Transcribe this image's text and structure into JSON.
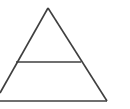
{
  "figure": {
    "name": "triangle-with-horizontal-divider",
    "canvas": {
      "width": 130,
      "height": 109,
      "background_color": "#ffffff"
    },
    "style": {
      "stroke_color": "#3f3f3f",
      "stroke_width": 1.6,
      "fill": "none",
      "line_cap": "butt",
      "line_join": "miter"
    },
    "points": {
      "apex": {
        "x": 48,
        "y": 8
      },
      "right_vertex": {
        "x": 107,
        "y": 101
      },
      "left_edge_exit": {
        "x": 0,
        "y": 93
      },
      "base_left_clip": {
        "x": 0,
        "y": 101
      },
      "divider_left": {
        "x": 16,
        "y": 62
      },
      "divider_right": {
        "x": 81,
        "y": 62
      }
    },
    "strokes": [
      {
        "id": "left-side",
        "label": "Left slanted side",
        "d": "M 48 8 L 0 93"
      },
      {
        "id": "right-side",
        "label": "Right slanted side",
        "d": "M 48 8 L 107 101"
      },
      {
        "id": "base-line",
        "label": "Base horizontal line",
        "d": "M 0 101 L 107 101"
      },
      {
        "id": "divider-line",
        "label": "Interior horizontal divider",
        "d": "M 16 62 L 81 62"
      }
    ],
    "regions": [
      {
        "id": "upper-section",
        "label": "Upper triangular section"
      },
      {
        "id": "lower-section",
        "label": "Lower trapezoidal section"
      }
    ]
  }
}
